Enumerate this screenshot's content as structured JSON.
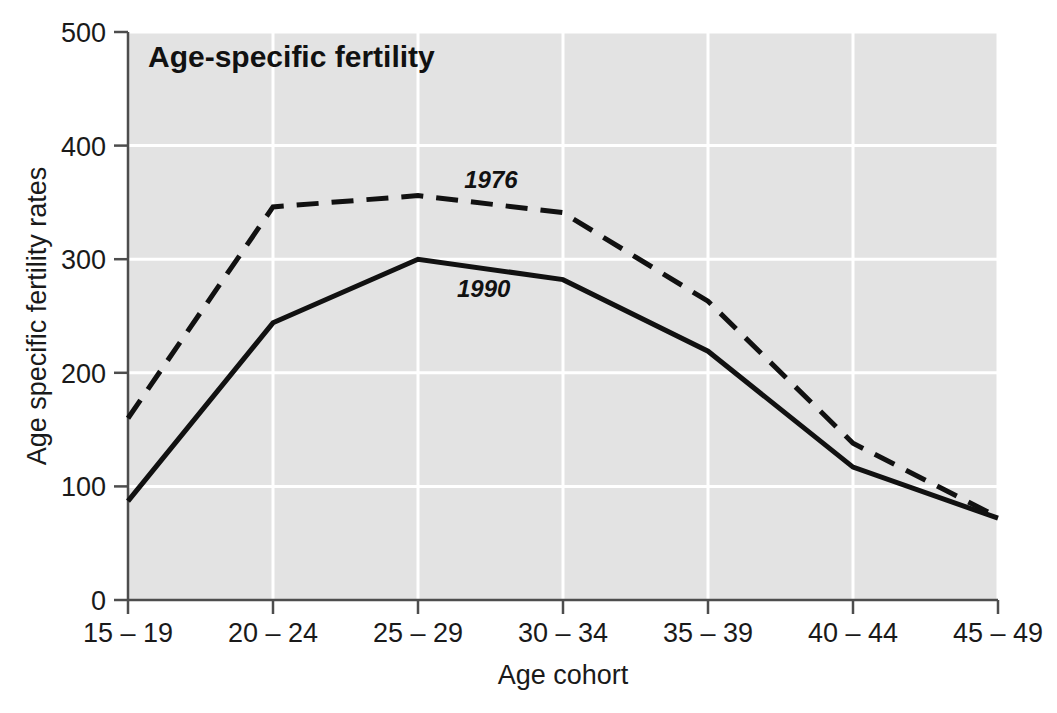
{
  "chart_data": {
    "type": "line",
    "title": "Age-specific fertility",
    "xlabel": "Age cohort",
    "ylabel": "Age specific fertility rates",
    "categories": [
      "15 – 19",
      "20 – 24",
      "25 – 29",
      "30 – 34",
      "35 – 39",
      "40 – 44",
      "45 – 49"
    ],
    "x_tick_labels": [
      "15 – 19",
      "20 – 24",
      "25 – 29",
      "30 – 34",
      "35 – 39",
      "40 – 44",
      "45 – 49"
    ],
    "y_tick_labels": [
      "0",
      "100",
      "200",
      "300",
      "400",
      "500"
    ],
    "y_ticks": [
      0,
      100,
      200,
      300,
      400,
      500
    ],
    "ylim": [
      0,
      500
    ],
    "grid": "horizontal-and-vertical-white-gridlines",
    "legend_position": "inline-annotations",
    "series": [
      {
        "name": "1976",
        "style": "dashed",
        "color": "#111111",
        "label_x_index": 2.25,
        "values": [
          160,
          346,
          356,
          341,
          263,
          138,
          73
        ]
      },
      {
        "name": "1990",
        "style": "solid",
        "color": "#111111",
        "label_x_index": 2.2,
        "values": [
          87,
          244,
          300,
          282,
          219,
          117,
          72
        ]
      }
    ],
    "annotations": [
      {
        "text": "1976",
        "series": "1976"
      },
      {
        "text": "1990",
        "series": "1990"
      }
    ],
    "colors": {
      "plot_background": "#e3e3e3",
      "gridline": "#ffffff",
      "axis": "#4d4d4d",
      "line": "#111111",
      "text": "#1a1a1a",
      "page_background": "#ffffff"
    }
  }
}
